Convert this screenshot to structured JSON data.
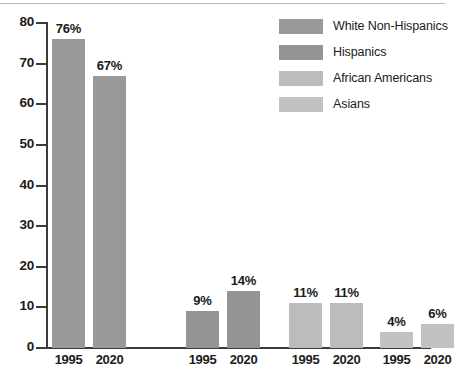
{
  "chart_data": {
    "type": "bar",
    "title": "",
    "subtitle": "",
    "xlabel": "",
    "ylabel": "",
    "ylim": [
      0,
      80
    ],
    "ytick_values": [
      0,
      10,
      20,
      30,
      40,
      50,
      60,
      70,
      80
    ],
    "ytick_labels": [
      "0",
      "10",
      "20",
      "30",
      "40",
      "50",
      "60",
      "70",
      "80"
    ],
    "grid": false,
    "legend_position": "top-right",
    "categories": [
      "1995",
      "2020"
    ],
    "value_suffix": "%",
    "series": [
      {
        "name": "White Non-Hispanics",
        "color": "#999999",
        "values": [
          76,
          67
        ],
        "labels": [
          "76%",
          "67%"
        ],
        "tick_labels": [
          "1995",
          "2020"
        ]
      },
      {
        "name": "Hispanics",
        "color": "#949494",
        "values": [
          9,
          14
        ],
        "labels": [
          "9%",
          "14%"
        ],
        "tick_labels": [
          "1995",
          "2020"
        ]
      },
      {
        "name": "African Americans",
        "color": "#bcbcbc",
        "values": [
          11,
          11
        ],
        "labels": [
          "11%",
          "11%"
        ],
        "tick_labels": [
          "1995",
          "2020"
        ]
      },
      {
        "name": "Asians",
        "color": "#c2c2c2",
        "values": [
          4,
          6
        ],
        "labels": [
          "4%",
          "6%"
        ],
        "tick_labels": [
          "1995",
          "2020"
        ]
      }
    ],
    "bars_flat": [
      {
        "group": "White Non-Hispanics",
        "category": "1995",
        "value": 76,
        "label": "76%"
      },
      {
        "group": "White Non-Hispanics",
        "category": "2020",
        "value": 67,
        "label": "67%"
      },
      {
        "group": "Hispanics",
        "category": "1995",
        "value": 9,
        "label": "9%"
      },
      {
        "group": "Hispanics",
        "category": "2020",
        "value": 14,
        "label": "14%"
      },
      {
        "group": "African Americans",
        "category": "1995",
        "value": 11,
        "label": "11%"
      },
      {
        "group": "African Americans",
        "category": "2020",
        "value": 11,
        "label": "11%"
      },
      {
        "group": "Asians",
        "category": "1995",
        "value": 4,
        "label": "4%"
      },
      {
        "group": "Asians",
        "category": "2020",
        "value": 6,
        "label": "6%"
      }
    ]
  },
  "legend": {
    "items": [
      {
        "label": "White Non-Hispanics",
        "color": "#999999"
      },
      {
        "label": "Hispanics",
        "color": "#949494"
      },
      {
        "label": "African Americans",
        "color": "#bcbcbc"
      },
      {
        "label": "Asians",
        "color": "#c2c2c2"
      }
    ]
  },
  "axis": {
    "y_labels": [
      "80",
      "70",
      "60",
      "50",
      "40",
      "30",
      "20",
      "10",
      "0"
    ],
    "x_labels": [
      "1995",
      "2020",
      "1995",
      "2020",
      "1995",
      "2020",
      "1995",
      "2020"
    ]
  },
  "colors": {
    "axis": "#3b3b3b",
    "text": "#1b1b1b",
    "background": "#ffffff"
  }
}
